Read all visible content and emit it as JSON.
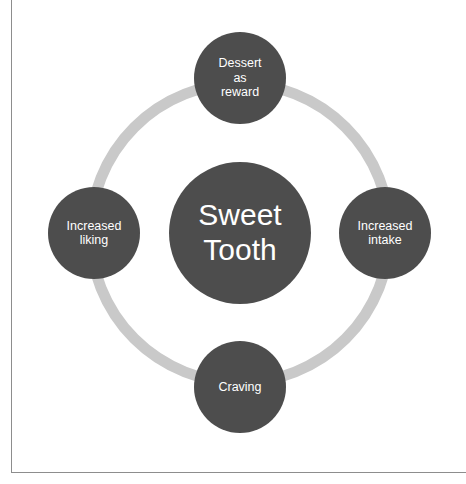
{
  "figure": {
    "type": "cycle-diagram",
    "title": "Sweet Tooth",
    "center": {
      "label": "Sweet\nTooth"
    },
    "nodes": [
      {
        "id": "dessert-as-reward",
        "label": "Dessert\nas\nreward",
        "position": "top"
      },
      {
        "id": "increased-intake",
        "label": "Increased\nintake",
        "position": "right"
      },
      {
        "id": "craving",
        "label": "Craving",
        "position": "bottom"
      },
      {
        "id": "increased-liking",
        "label": "Increased\nliking",
        "position": "left"
      }
    ],
    "colors": {
      "node_fill": "#4d4d4d",
      "node_text": "#ffffff",
      "ring": "#c9c9c9",
      "background": "#ffffff",
      "frame_line": "#8d8d8d"
    }
  }
}
